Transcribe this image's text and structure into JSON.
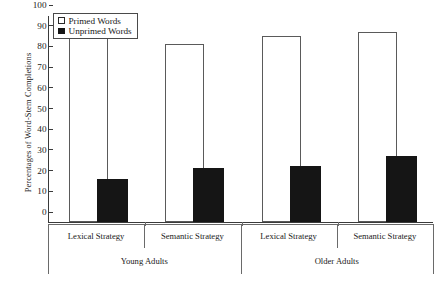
{
  "chart_data": {
    "type": "bar",
    "title": "",
    "xlabel": "",
    "ylabel": "Percentages of Word-Stem Completions",
    "ylim": [
      0,
      100
    ],
    "yticks": [
      0,
      10,
      20,
      30,
      40,
      50,
      60,
      70,
      80,
      90,
      100
    ],
    "grid": false,
    "legend_position": "top-left",
    "categories": [
      "Lexical Strategy",
      "Semantic Strategy",
      "Lexical Strategy",
      "Semantic Strategy"
    ],
    "group_labels": [
      "Young Adults",
      "Older Adults"
    ],
    "series": [
      {
        "name": "Primed Words",
        "values": [
          89,
          86,
          90,
          92
        ],
        "color": "#ffffff"
      },
      {
        "name": "Unprimed Words",
        "values": [
          21,
          26,
          27,
          32
        ],
        "color": "#151515"
      }
    ]
  },
  "legend": {
    "items": [
      {
        "label": "Primed Words",
        "swatch": "open-square"
      },
      {
        "label": "Unprimed Words",
        "swatch": "filled-square"
      }
    ]
  },
  "axes": {
    "y_title": "Percentages of Word-Stem Completions",
    "y_tick_labels": [
      "100",
      "90",
      "80",
      "70",
      "60",
      "50",
      "40",
      "30",
      "20",
      "10",
      "0"
    ],
    "x_strategy_labels": [
      "Lexical Strategy",
      "Semantic Strategy",
      "Lexical Strategy",
      "Semantic Strategy"
    ],
    "x_group_labels": [
      "Young Adults",
      "Older Adults"
    ]
  }
}
